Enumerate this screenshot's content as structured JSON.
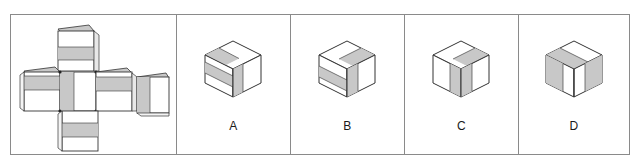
{
  "figure": {
    "type": "spatial-reasoning-cube-folding",
    "frame_border_color": "#8a8a8a",
    "background_color": "#ffffff",
    "face_white": "#ffffff",
    "face_gray": "#c8c8c8",
    "face_gray_dark": "#b4b4b4",
    "outline_color": "#333333",
    "panel_count": 5
  },
  "net_panel": {
    "name": "cube-net",
    "description": "Unfolded cube net, cross/T shape with six square faces, each face bearing a gray stripe",
    "faces": [
      {
        "id": "top",
        "position": "row1-col2",
        "stripe": "horizontal-middle"
      },
      {
        "id": "left",
        "position": "row2-col1",
        "stripe": "horizontal-upper"
      },
      {
        "id": "front",
        "position": "row2-col2",
        "stripe": "vertical-left"
      },
      {
        "id": "right",
        "position": "row2-col3",
        "stripe": "horizontal-upper"
      },
      {
        "id": "back",
        "position": "row2-col4",
        "stripe": "vertical-left"
      },
      {
        "id": "bottom",
        "position": "row3-col2",
        "stripe": "horizontal-middle"
      }
    ]
  },
  "options": [
    {
      "label": "A",
      "name": "option-a",
      "top_face_stripe": "band-parallel-to-left-edge",
      "left_face_stripe": "horizontal-upper-band",
      "right_face_stripe": "vertical-band-left"
    },
    {
      "label": "B",
      "name": "option-b",
      "top_face_stripe": "band-parallel-to-right-edge",
      "left_face_stripe": "horizontal-middle-band",
      "right_face_stripe": "vertical-band-left"
    },
    {
      "label": "C",
      "name": "option-c",
      "top_face_stripe": "band-parallel-to-right-edge",
      "left_face_stripe": "vertical-band-right",
      "right_face_stripe": "vertical-band-left"
    },
    {
      "label": "D",
      "name": "option-d",
      "top_face_stripe": "band-parallel-to-left-edge",
      "left_face_stripe": "vertical-band-left",
      "right_face_stripe": "vertical-band-right"
    }
  ]
}
